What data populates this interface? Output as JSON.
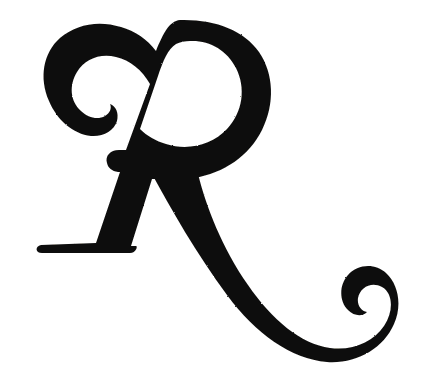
{
  "image": {
    "kind": "scanned-decorative-glyph",
    "width": 436,
    "height": 368,
    "background_color": "#ffffff",
    "ink_color": "#100f0d",
    "alt_text": "Large black calligraphic swash capital letter R on a white background",
    "caption": "R"
  },
  "glyph": {
    "character": "R",
    "name": "swash-capital-r",
    "style": "calligraphic italic swash capital",
    "script": "Latin",
    "case": "uppercase",
    "parts": [
      {
        "name": "top-left-curl",
        "description": "spiral hook terminal opening to the right at the start of the top arch",
        "bbox": [
          34,
          52,
          112,
          138
        ]
      },
      {
        "name": "top-arch",
        "description": "arch sweeping up and right from the curl to the apex",
        "bbox": [
          60,
          20,
          200,
          96
        ]
      },
      {
        "name": "bowl",
        "description": "large tilted oval bowl forming the enclosed counter of the R",
        "bbox": [
          118,
          20,
          272,
          180
        ]
      },
      {
        "name": "bowl-counter",
        "description": "white enclosed oval inside the bowl",
        "bbox": [
          158,
          40,
          246,
          148
        ]
      },
      {
        "name": "stem",
        "description": "thick diagonal stem descending from the apex to the lower left",
        "bbox": [
          60,
          60,
          190,
          250
        ]
      },
      {
        "name": "foot-serif",
        "description": "flat horizontal slab foot at the base of the stem",
        "bbox": [
          35,
          238,
          136,
          253
        ]
      },
      {
        "name": "leg-swash",
        "description": "long sweeping leg descending right from the bowl base",
        "bbox": [
          150,
          150,
          400,
          350
        ]
      },
      {
        "name": "tail-hook",
        "description": "upward curling ball terminal at the end of the swash leg",
        "bbox": [
          352,
          288,
          404,
          352
        ]
      },
      {
        "name": "stem-leg-gap",
        "description": "triangular white gap between the stem and the descending leg",
        "bbox": [
          120,
          160,
          200,
          250
        ]
      }
    ],
    "colors": {
      "ink": "#100f0d",
      "paper": "#ffffff"
    }
  }
}
